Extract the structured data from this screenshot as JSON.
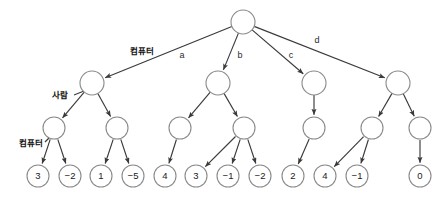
{
  "diagram": {
    "canvas": {
      "width": 448,
      "height": 202,
      "background": "#ffffff"
    },
    "style": {
      "node_stroke": "#8a8a8a",
      "node_fill": "#ffffff",
      "edge_stroke": "#3a3a3a",
      "text_color": "#1a1a1a",
      "node_radius": 12,
      "leaf_radius": 11
    },
    "tier_labels": [
      {
        "id": "tier-label-computer-top",
        "text": "컴퓨터",
        "x": 142,
        "y": 51
      },
      {
        "id": "tier-label-human",
        "text": "사람",
        "x": 60,
        "y": 95
      },
      {
        "id": "tier-label-computer-bottom",
        "text": "컴퓨터",
        "x": 31,
        "y": 143
      }
    ],
    "edge_labels": [
      {
        "id": "edge-label-a",
        "text": "a",
        "x": 182,
        "y": 56
      },
      {
        "id": "edge-label-b",
        "text": "b",
        "x": 240,
        "y": 56
      },
      {
        "id": "edge-label-c",
        "text": "c",
        "x": 291,
        "y": 56
      },
      {
        "id": "edge-label-d",
        "text": "d",
        "x": 317,
        "y": 41
      }
    ],
    "nodes": {
      "root": {
        "id": "node-root",
        "x": 243,
        "y": 22,
        "r": 12,
        "label": ""
      },
      "level2": [
        {
          "id": "node-a",
          "x": 92,
          "y": 83,
          "r": 12,
          "label": ""
        },
        {
          "id": "node-b",
          "x": 218,
          "y": 83,
          "r": 12,
          "label": ""
        },
        {
          "id": "node-c",
          "x": 314,
          "y": 83,
          "r": 12,
          "label": ""
        },
        {
          "id": "node-d",
          "x": 398,
          "y": 83,
          "r": 12,
          "label": ""
        }
      ],
      "level3": [
        {
          "id": "node-a1",
          "x": 54,
          "y": 128,
          "r": 11,
          "label": ""
        },
        {
          "id": "node-a2",
          "x": 117,
          "y": 128,
          "r": 11,
          "label": ""
        },
        {
          "id": "node-b1",
          "x": 180,
          "y": 128,
          "r": 11,
          "label": ""
        },
        {
          "id": "node-b2",
          "x": 244,
          "y": 128,
          "r": 11,
          "label": ""
        },
        {
          "id": "node-c1",
          "x": 314,
          "y": 128,
          "r": 11,
          "label": ""
        },
        {
          "id": "node-d1",
          "x": 372,
          "y": 128,
          "r": 11,
          "label": ""
        },
        {
          "id": "node-d2",
          "x": 420,
          "y": 128,
          "r": 11,
          "label": ""
        }
      ],
      "leaves": [
        {
          "id": "leaf-1",
          "x": 38,
          "y": 176,
          "r": 11,
          "value": "3"
        },
        {
          "id": "leaf-2",
          "x": 70,
          "y": 176,
          "r": 11,
          "value": "−2"
        },
        {
          "id": "leaf-3",
          "x": 101,
          "y": 176,
          "r": 11,
          "value": "1"
        },
        {
          "id": "leaf-4",
          "x": 133,
          "y": 176,
          "r": 11,
          "value": "−5"
        },
        {
          "id": "leaf-5",
          "x": 165,
          "y": 176,
          "r": 11,
          "value": "4"
        },
        {
          "id": "leaf-6",
          "x": 196,
          "y": 176,
          "r": 11,
          "value": "3"
        },
        {
          "id": "leaf-7",
          "x": 228,
          "y": 176,
          "r": 11,
          "value": "−1"
        },
        {
          "id": "leaf-8",
          "x": 260,
          "y": 176,
          "r": 11,
          "value": "−2"
        },
        {
          "id": "leaf-9",
          "x": 293,
          "y": 176,
          "r": 11,
          "value": "2"
        },
        {
          "id": "leaf-10",
          "x": 325,
          "y": 176,
          "r": 11,
          "value": "4"
        },
        {
          "id": "leaf-11",
          "x": 357,
          "y": 176,
          "r": 11,
          "value": "−1"
        },
        {
          "id": "leaf-12",
          "x": 420,
          "y": 176,
          "r": 11,
          "value": "0"
        }
      ]
    },
    "edges": [
      {
        "id": "edge-root-a",
        "x1": 243,
        "y1": 22,
        "x2": 92,
        "y2": 83
      },
      {
        "id": "edge-root-b",
        "x1": 243,
        "y1": 22,
        "x2": 218,
        "y2": 83
      },
      {
        "id": "edge-root-c",
        "x1": 243,
        "y1": 22,
        "x2": 314,
        "y2": 83
      },
      {
        "id": "edge-root-d",
        "x1": 243,
        "y1": 22,
        "x2": 398,
        "y2": 83
      },
      {
        "id": "edge-a-a1",
        "x1": 92,
        "y1": 83,
        "x2": 54,
        "y2": 128
      },
      {
        "id": "edge-a-a2",
        "x1": 92,
        "y1": 83,
        "x2": 117,
        "y2": 128
      },
      {
        "id": "edge-b-b1",
        "x1": 218,
        "y1": 83,
        "x2": 180,
        "y2": 128
      },
      {
        "id": "edge-b-b2",
        "x1": 218,
        "y1": 83,
        "x2": 244,
        "y2": 128
      },
      {
        "id": "edge-c-c1",
        "x1": 314,
        "y1": 83,
        "x2": 314,
        "y2": 128
      },
      {
        "id": "edge-d-d1",
        "x1": 398,
        "y1": 83,
        "x2": 372,
        "y2": 128
      },
      {
        "id": "edge-d-d2",
        "x1": 398,
        "y1": 83,
        "x2": 420,
        "y2": 128
      },
      {
        "id": "edge-a1-l1",
        "x1": 54,
        "y1": 128,
        "x2": 38,
        "y2": 176
      },
      {
        "id": "edge-a1-l2",
        "x1": 54,
        "y1": 128,
        "x2": 70,
        "y2": 176
      },
      {
        "id": "edge-a2-l3",
        "x1": 117,
        "y1": 128,
        "x2": 101,
        "y2": 176
      },
      {
        "id": "edge-a2-l4",
        "x1": 117,
        "y1": 128,
        "x2": 133,
        "y2": 176
      },
      {
        "id": "edge-b1-l5",
        "x1": 180,
        "y1": 128,
        "x2": 165,
        "y2": 176
      },
      {
        "id": "edge-b2-l6",
        "x1": 244,
        "y1": 128,
        "x2": 196,
        "y2": 176
      },
      {
        "id": "edge-b2-l7",
        "x1": 244,
        "y1": 128,
        "x2": 228,
        "y2": 176
      },
      {
        "id": "edge-b2-l8",
        "x1": 244,
        "y1": 128,
        "x2": 260,
        "y2": 176
      },
      {
        "id": "edge-c1-l9",
        "x1": 314,
        "y1": 128,
        "x2": 293,
        "y2": 176
      },
      {
        "id": "edge-d1-l10",
        "x1": 372,
        "y1": 128,
        "x2": 325,
        "y2": 176
      },
      {
        "id": "edge-d1-l11",
        "x1": 372,
        "y1": 128,
        "x2": 357,
        "y2": 176
      },
      {
        "id": "edge-d2-l12",
        "x1": 420,
        "y1": 128,
        "x2": 420,
        "y2": 176
      }
    ],
    "tier_label_connectors": [
      {
        "id": "connector-human",
        "x1": 74,
        "y1": 95,
        "x2": 84,
        "y2": 91
      },
      {
        "id": "connector-computer-bottom",
        "x1": 45,
        "y1": 142,
        "x2": 49,
        "y2": 138
      }
    ]
  }
}
